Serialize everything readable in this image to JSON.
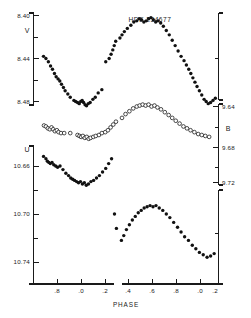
{
  "figure": {
    "title": "HDE 234677",
    "xlabel": "PHASE",
    "background": "#ffffff",
    "ink_color": "#111111"
  },
  "axes": {
    "left_upper": {
      "band": "V",
      "ticks": [
        "8.40",
        "8.44",
        "8.48"
      ],
      "values": [
        8.4,
        8.44,
        8.48
      ]
    },
    "left_lower": {
      "band": "U",
      "ticks": [
        "10.66",
        "10.70",
        "10.74"
      ],
      "values": [
        10.66,
        10.7,
        10.74
      ]
    },
    "right": {
      "band": "B",
      "ticks": [
        "9.64",
        "9.68",
        "9.72"
      ],
      "values": [
        9.64,
        9.68,
        9.72
      ]
    },
    "x_left_segment": {
      "ticks": [
        ".8",
        ".0",
        ".2"
      ],
      "values": [
        0.8,
        0.0,
        0.2
      ]
    },
    "x_right_segment": {
      "ticks": [
        ".4",
        ".6",
        ".8",
        ".0",
        ".2"
      ],
      "values": [
        0.4,
        0.6,
        0.8,
        0.0,
        0.2
      ]
    }
  },
  "chart_data": {
    "type": "scatter",
    "title": "HDE 234677",
    "xlabel": "PHASE",
    "ylabel": "Magnitude",
    "grid": false,
    "legend": "none",
    "note": "Photometric light curves of the eclipsing binary HDE 234677 in three bands. Magnitude axes are inverted (brighter upward). X axis is orbital phase, broken, covering roughly phase 0.65 to 1.30 across two joined segments.",
    "xlim": [
      0.65,
      1.32
    ],
    "x_break": [
      0.98,
      1.02
    ],
    "series": [
      {
        "name": "V",
        "marker": "filled-circle",
        "axis": "left-upper",
        "ylim": [
          8.5,
          8.385
        ],
        "ylabel": "V",
        "points": [
          [
            0.69,
            8.438
          ],
          [
            0.7,
            8.44
          ],
          [
            0.71,
            8.443
          ],
          [
            0.719,
            8.447
          ],
          [
            0.727,
            8.45
          ],
          [
            0.735,
            8.454
          ],
          [
            0.742,
            8.457
          ],
          [
            0.75,
            8.459
          ],
          [
            0.757,
            8.461
          ],
          [
            0.764,
            8.464
          ],
          [
            0.772,
            8.467
          ],
          [
            0.779,
            8.47
          ],
          [
            0.79,
            8.473
          ],
          [
            0.8,
            8.476
          ],
          [
            0.815,
            8.479
          ],
          [
            0.822,
            8.48
          ],
          [
            0.83,
            8.481
          ],
          [
            0.837,
            8.482
          ],
          [
            0.843,
            8.48
          ],
          [
            0.849,
            8.479
          ],
          [
            0.855,
            8.481
          ],
          [
            0.861,
            8.483
          ],
          [
            0.867,
            8.484
          ],
          [
            0.874,
            8.482
          ],
          [
            0.882,
            8.481
          ],
          [
            0.893,
            8.478
          ],
          [
            0.903,
            8.476
          ],
          [
            0.915,
            8.472
          ],
          [
            0.93,
            8.469
          ],
          [
            0.946,
            8.443
          ],
          [
            0.96,
            8.44
          ],
          [
            0.968,
            8.436
          ],
          [
            0.975,
            8.432
          ],
          [
            0.981,
            8.428
          ],
          [
            0.987,
            8.424
          ],
          [
            0.993,
            8.421
          ],
          [
            1.0,
            8.418
          ],
          [
            1.008,
            8.415
          ],
          [
            1.018,
            8.412
          ],
          [
            1.03,
            8.409
          ],
          [
            1.04,
            8.406
          ],
          [
            1.05,
            8.405
          ],
          [
            1.058,
            8.403
          ],
          [
            1.066,
            8.404
          ],
          [
            1.074,
            8.406
          ],
          [
            1.082,
            8.405
          ],
          [
            1.09,
            8.403
          ],
          [
            1.098,
            8.402
          ],
          [
            1.106,
            8.404
          ],
          [
            1.114,
            8.406
          ],
          [
            1.122,
            8.405
          ],
          [
            1.131,
            8.407
          ],
          [
            1.14,
            8.41
          ],
          [
            1.15,
            8.414
          ],
          [
            1.16,
            8.418
          ],
          [
            1.17,
            8.423
          ],
          [
            1.18,
            8.428
          ],
          [
            1.19,
            8.433
          ],
          [
            1.2,
            8.438
          ],
          [
            1.21,
            8.442
          ],
          [
            1.218,
            8.446
          ],
          [
            1.226,
            8.45
          ],
          [
            1.233,
            8.454
          ],
          [
            1.24,
            8.458
          ],
          [
            1.247,
            8.462
          ],
          [
            1.254,
            8.466
          ],
          [
            1.262,
            8.47
          ],
          [
            1.27,
            8.474
          ],
          [
            1.278,
            8.478
          ],
          [
            1.285,
            8.48
          ],
          [
            1.292,
            8.482
          ],
          [
            1.3,
            8.481
          ],
          [
            1.308,
            8.479
          ],
          [
            1.316,
            8.477
          ]
        ]
      },
      {
        "name": "B",
        "marker": "open-circle",
        "axis": "right",
        "ylim": [
          9.745,
          9.615
        ],
        "ylabel": "B",
        "points": [
          [
            0.692,
            9.66
          ],
          [
            0.7,
            9.661
          ],
          [
            0.708,
            9.663
          ],
          [
            0.716,
            9.664
          ],
          [
            0.723,
            9.662
          ],
          [
            0.73,
            9.664
          ],
          [
            0.737,
            9.666
          ],
          [
            0.745,
            9.665
          ],
          [
            0.752,
            9.667
          ],
          [
            0.762,
            9.668
          ],
          [
            0.775,
            9.668
          ],
          [
            0.8,
            9.668
          ],
          [
            0.83,
            9.67
          ],
          [
            0.838,
            9.671
          ],
          [
            0.845,
            9.672
          ],
          [
            0.852,
            9.671
          ],
          [
            0.86,
            9.673
          ],
          [
            0.868,
            9.672
          ],
          [
            0.876,
            9.674
          ],
          [
            0.884,
            9.673
          ],
          [
            0.895,
            9.672
          ],
          [
            0.905,
            9.671
          ],
          [
            0.918,
            9.67
          ],
          [
            0.93,
            9.668
          ],
          [
            0.944,
            9.667
          ],
          [
            0.955,
            9.665
          ],
          [
            0.966,
            9.662
          ],
          [
            0.977,
            9.659
          ],
          [
            0.988,
            9.656
          ],
          [
            1.0,
            9.652
          ],
          [
            1.012,
            9.648
          ],
          [
            1.025,
            9.645
          ],
          [
            1.038,
            9.642
          ],
          [
            1.05,
            9.64
          ],
          [
            1.06,
            9.639
          ],
          [
            1.07,
            9.638
          ],
          [
            1.08,
            9.639
          ],
          [
            1.09,
            9.638
          ],
          [
            1.1,
            9.64
          ],
          [
            1.11,
            9.639
          ],
          [
            1.12,
            9.641
          ],
          [
            1.132,
            9.643
          ],
          [
            1.145,
            9.646
          ],
          [
            1.158,
            9.649
          ],
          [
            1.17,
            9.652
          ],
          [
            1.182,
            9.655
          ],
          [
            1.195,
            9.658
          ],
          [
            1.208,
            9.661
          ],
          [
            1.22,
            9.663
          ],
          [
            1.232,
            9.665
          ],
          [
            1.245,
            9.667
          ],
          [
            1.258,
            9.669
          ],
          [
            1.27,
            9.67
          ],
          [
            1.282,
            9.671
          ],
          [
            1.295,
            9.672
          ]
        ]
      },
      {
        "name": "U",
        "marker": "filled-circle",
        "axis": "left-lower",
        "ylim": [
          10.775,
          10.64
        ],
        "ylabel": "U",
        "points": [
          [
            0.69,
            10.652
          ],
          [
            0.7,
            10.654
          ],
          [
            0.706,
            10.656
          ],
          [
            0.712,
            10.657
          ],
          [
            0.718,
            10.658
          ],
          [
            0.725,
            10.657
          ],
          [
            0.732,
            10.659
          ],
          [
            0.74,
            10.66
          ],
          [
            0.748,
            10.661
          ],
          [
            0.758,
            10.66
          ],
          [
            0.77,
            10.663
          ],
          [
            0.782,
            10.666
          ],
          [
            0.793,
            10.668
          ],
          [
            0.802,
            10.67
          ],
          [
            0.81,
            10.671
          ],
          [
            0.818,
            10.672
          ],
          [
            0.826,
            10.673
          ],
          [
            0.834,
            10.674
          ],
          [
            0.842,
            10.673
          ],
          [
            0.85,
            10.675
          ],
          [
            0.858,
            10.674
          ],
          [
            0.866,
            10.676
          ],
          [
            0.875,
            10.675
          ],
          [
            0.885,
            10.673
          ],
          [
            0.896,
            10.672
          ],
          [
            0.908,
            10.67
          ],
          [
            0.92,
            10.668
          ],
          [
            0.933,
            10.665
          ],
          [
            0.946,
            10.662
          ],
          [
            0.958,
            10.658
          ],
          [
            0.97,
            10.654
          ],
          [
            0.982,
            10.7
          ],
          [
            0.99,
            10.712
          ],
          [
            0.998,
            10.722
          ],
          [
            1.006,
            10.718
          ],
          [
            1.015,
            10.713
          ],
          [
            1.025,
            10.709
          ],
          [
            1.035,
            10.705
          ],
          [
            1.045,
            10.702
          ],
          [
            1.055,
            10.699
          ],
          [
            1.065,
            10.697
          ],
          [
            1.075,
            10.695
          ],
          [
            1.085,
            10.694
          ],
          [
            1.095,
            10.693
          ],
          [
            1.105,
            10.694
          ],
          [
            1.115,
            10.693
          ],
          [
            1.126,
            10.695
          ],
          [
            1.138,
            10.697
          ],
          [
            1.15,
            10.7
          ],
          [
            1.162,
            10.703
          ],
          [
            1.175,
            10.707
          ],
          [
            1.188,
            10.711
          ],
          [
            1.2,
            10.715
          ],
          [
            1.212,
            10.719
          ],
          [
            1.225,
            10.722
          ],
          [
            1.238,
            10.726
          ],
          [
            1.25,
            10.729
          ],
          [
            1.262,
            10.732
          ],
          [
            1.275,
            10.734
          ],
          [
            1.288,
            10.736
          ],
          [
            1.3,
            10.735
          ],
          [
            1.312,
            10.733
          ]
        ]
      }
    ]
  }
}
